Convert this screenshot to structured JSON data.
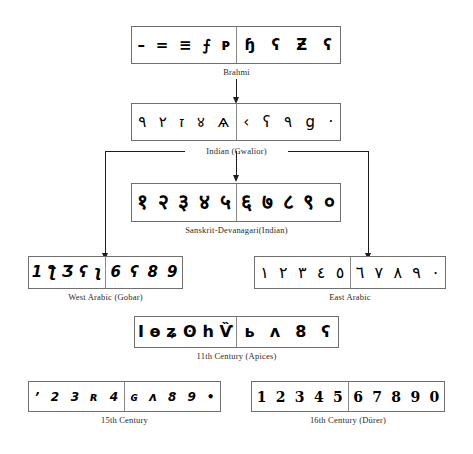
{
  "diagram": {
    "accent_color": "#1d1d1d",
    "box_border_color": "#6f6f6f"
  },
  "rows": [
    {
      "id": "brahmi",
      "label": "Brahmi",
      "left_digits": [
        "–",
        "=",
        "≡",
        "⨍",
        "ᴩ"
      ],
      "right_digits": [
        "ɧ",
        "ʕ",
        "Ƶ",
        "ʕ"
      ]
    },
    {
      "id": "gwalior",
      "label": "Indian (Gwalior)",
      "left_digits": [
        "٩",
        "٢",
        "ז",
        "४",
        "ѧ"
      ],
      "right_digits": [
        "‹",
        "ʕ",
        "٩",
        "ց",
        "·"
      ]
    },
    {
      "id": "devanagari",
      "label": "Sanskrit-Devanagari(Indian)",
      "left_digits": [
        "१",
        "२",
        "३",
        "४",
        "५"
      ],
      "right_digits": [
        "६",
        "७",
        "८",
        "९",
        "०"
      ]
    },
    {
      "id": "gobar",
      "label": "West Arabic (Gobar)",
      "left_digits": [
        "1",
        "ƪ",
        "Ʒ",
        "ʕ",
        "ʅ"
      ],
      "right_digits": [
        "6",
        "ʕ",
        "8",
        "9"
      ]
    },
    {
      "id": "east-arabic",
      "label": "East Arabic",
      "left_digits": [
        "١",
        "٢",
        "٣",
        "٤",
        "٥"
      ],
      "right_digits": [
        "٦",
        "٧",
        "٨",
        "٩",
        "٠"
      ]
    },
    {
      "id": "apices",
      "label": "11th Century (Apices)",
      "left_digits": [
        "I",
        "ѳ",
        "ʑ",
        "ʘ",
        "һ",
        "Ѷ"
      ],
      "right_digits": [
        "ь",
        "ʌ",
        "8",
        "ʕ"
      ]
    },
    {
      "id": "c15",
      "label": "15th Century",
      "left_digits": [
        "ʼ",
        "2",
        "3",
        "ʀ",
        "4"
      ],
      "right_digits": [
        "ɢ",
        "ʌ",
        "8",
        "9",
        "•"
      ]
    },
    {
      "id": "c16",
      "label": "16th Century (Dürer)",
      "left_digits": [
        "1",
        "2",
        "3",
        "4",
        "5"
      ],
      "right_digits": [
        "6",
        "7",
        "8",
        "9",
        "0"
      ]
    }
  ],
  "connectors": [
    {
      "name": "brahmi-to-gwalior",
      "kind": "arrow-down"
    },
    {
      "name": "gwalior-to-west-arabic",
      "kind": "elbow-left-down"
    },
    {
      "name": "gwalior-to-devanagari",
      "kind": "arrow-down"
    },
    {
      "name": "gwalior-to-east-arabic",
      "kind": "elbow-right-down"
    }
  ]
}
